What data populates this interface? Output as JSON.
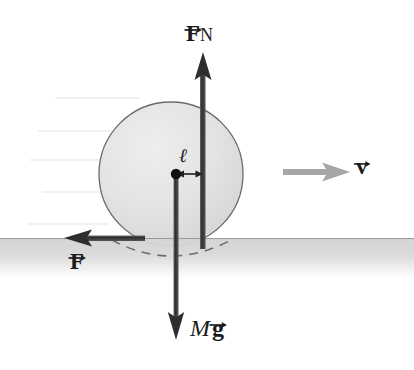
{
  "figure": {
    "type": "free-body-diagram",
    "width": 414,
    "height": 370,
    "background_color": "#ffffff"
  },
  "colors": {
    "sphere_fill": "#e2e2e2",
    "sphere_stroke": "#5a5a5a",
    "ground_fill": "#d2d2d2",
    "ground_line": "#8a8a8a",
    "force_arrow": "#3a3a3a",
    "velocity_arrow": "#9b9b9b",
    "label_text": "#1a1a1a",
    "streak_line": "#e8e8e8",
    "dashed_arc": "#6e6e6e"
  },
  "sphere": {
    "name": "rolling-sphere",
    "center_x": 171,
    "center_y": 174,
    "radius": 72,
    "contact_note": "bottom of sphere sinks below ground surface line"
  },
  "center_marker": {
    "name": "center-of-mass-dot",
    "x": 176,
    "y": 174,
    "radius": 5
  },
  "ground": {
    "name": "ground-surface",
    "top_y": 238,
    "bottom_y": 276,
    "label": ""
  },
  "dashed_arc": {
    "name": "deformed-contact-arc",
    "description": "dashed outline of sphere portion below the surface"
  },
  "vectors": [
    {
      "id": "normal-force",
      "label_main": "F",
      "label_subscript": "N",
      "label_full": "F_N",
      "accent": "vector-arrow",
      "direction": "up",
      "x": 203,
      "tail_y": 248,
      "head_y": 64,
      "color": "#3a3a3a",
      "label_x": 186,
      "label_y": 22
    },
    {
      "id": "weight",
      "label_main": "M",
      "label_vector": "g",
      "label_full": "M g",
      "accent": "vector-arrow",
      "direction": "down",
      "x": 176,
      "tail_y": 174,
      "head_y": 338,
      "color": "#3a3a3a",
      "label_x": 190,
      "label_y": 316
    },
    {
      "id": "friction-force",
      "label_main": "F",
      "label_full": "F",
      "accent": "vector-arrow",
      "direction": "left",
      "y": 238,
      "tail_x": 145,
      "head_x": 66,
      "color": "#3a3a3a",
      "label_x": 70,
      "label_y": 250
    },
    {
      "id": "velocity",
      "label_main": "v",
      "label_full": "v",
      "accent": "vector-arrow",
      "direction": "right",
      "y": 172,
      "tail_x": 283,
      "head_x": 348,
      "color": "#9b9b9b",
      "label_x": 356,
      "label_y": 155
    }
  ],
  "dimension": {
    "id": "offset-length",
    "label": "ℓ",
    "description": "horizontal offset between center of mass and normal force line of action",
    "from_x": 176,
    "to_x": 203,
    "y": 174,
    "label_x": 179,
    "label_y": 146
  },
  "streak_lines": {
    "name": "scan-streak-artifacts",
    "count": 5,
    "rows_y": [
      98,
      131,
      160,
      192,
      224
    ]
  }
}
